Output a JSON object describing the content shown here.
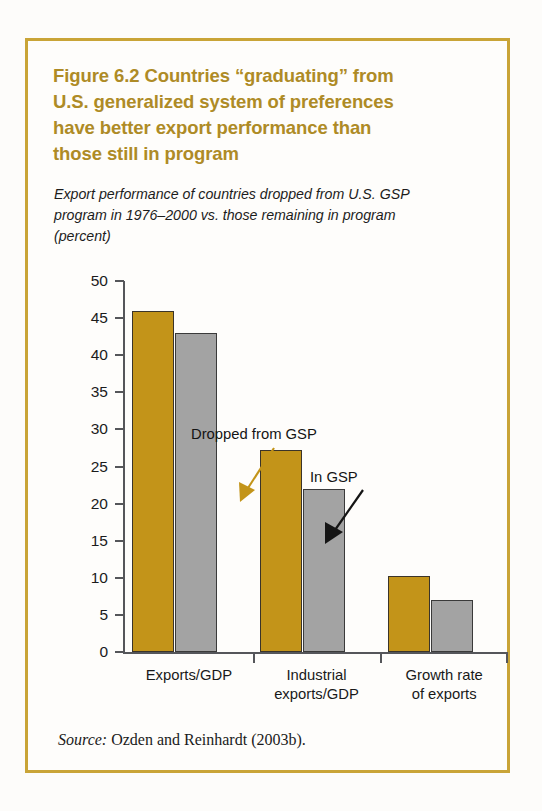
{
  "figure": {
    "title_lines": [
      "Figure 6.2  Countries “graduating” from",
      "U.S. generalized system of preferences",
      "have better export performance than",
      "those still in program"
    ],
    "subtitle_lines": [
      "Export performance of countries dropped from U.S. GSP",
      "program in 1976–2000 vs. those remaining in program",
      "(percent)"
    ],
    "source_keyword": "Source:",
    "source_text": " Ozden and Reinhardt (2003b).",
    "frame_color": "#c9a437",
    "title_color": "#ae8b26"
  },
  "chart_data": {
    "type": "bar",
    "title": "Figure 6.2  Countries “graduating” from U.S. generalized system of preferences have better export performance than those still in program",
    "subtitle": "Export performance of countries dropped from U.S. GSP program in 1976–2000 vs. those remaining in program (percent)",
    "categories": [
      "Exports/GDP",
      "Industrial exports/GDP",
      "Growth rate of exports"
    ],
    "category_label_lines": [
      [
        "Exports/GDP"
      ],
      [
        "Industrial",
        "exports/GDP"
      ],
      [
        "Growth rate",
        "of exports"
      ]
    ],
    "series": [
      {
        "name": "Dropped from GSP",
        "color": "#c39419",
        "values": [
          46.0,
          27.2,
          10.2
        ]
      },
      {
        "name": "In GSP",
        "color": "#a3a3a3",
        "values": [
          43.0,
          22.0,
          7.0
        ]
      }
    ],
    "xlabel": "",
    "ylabel": "",
    "ylim": [
      0,
      50
    ],
    "yticks": [
      0,
      5,
      10,
      15,
      20,
      25,
      30,
      35,
      40,
      45,
      50
    ],
    "ytick_labels": [
      "0",
      "5",
      "10",
      "15",
      "20",
      "25",
      "30",
      "35",
      "40",
      "45",
      "50"
    ],
    "grid": false,
    "legend": "annotations",
    "annotations": [
      {
        "text": "Dropped from GSP",
        "arrow_color": "#c39419",
        "points_to": "series-0-bar-1"
      },
      {
        "text": "In GSP",
        "arrow_color": "#151515",
        "points_to": "series-1-bar-1"
      }
    ]
  }
}
